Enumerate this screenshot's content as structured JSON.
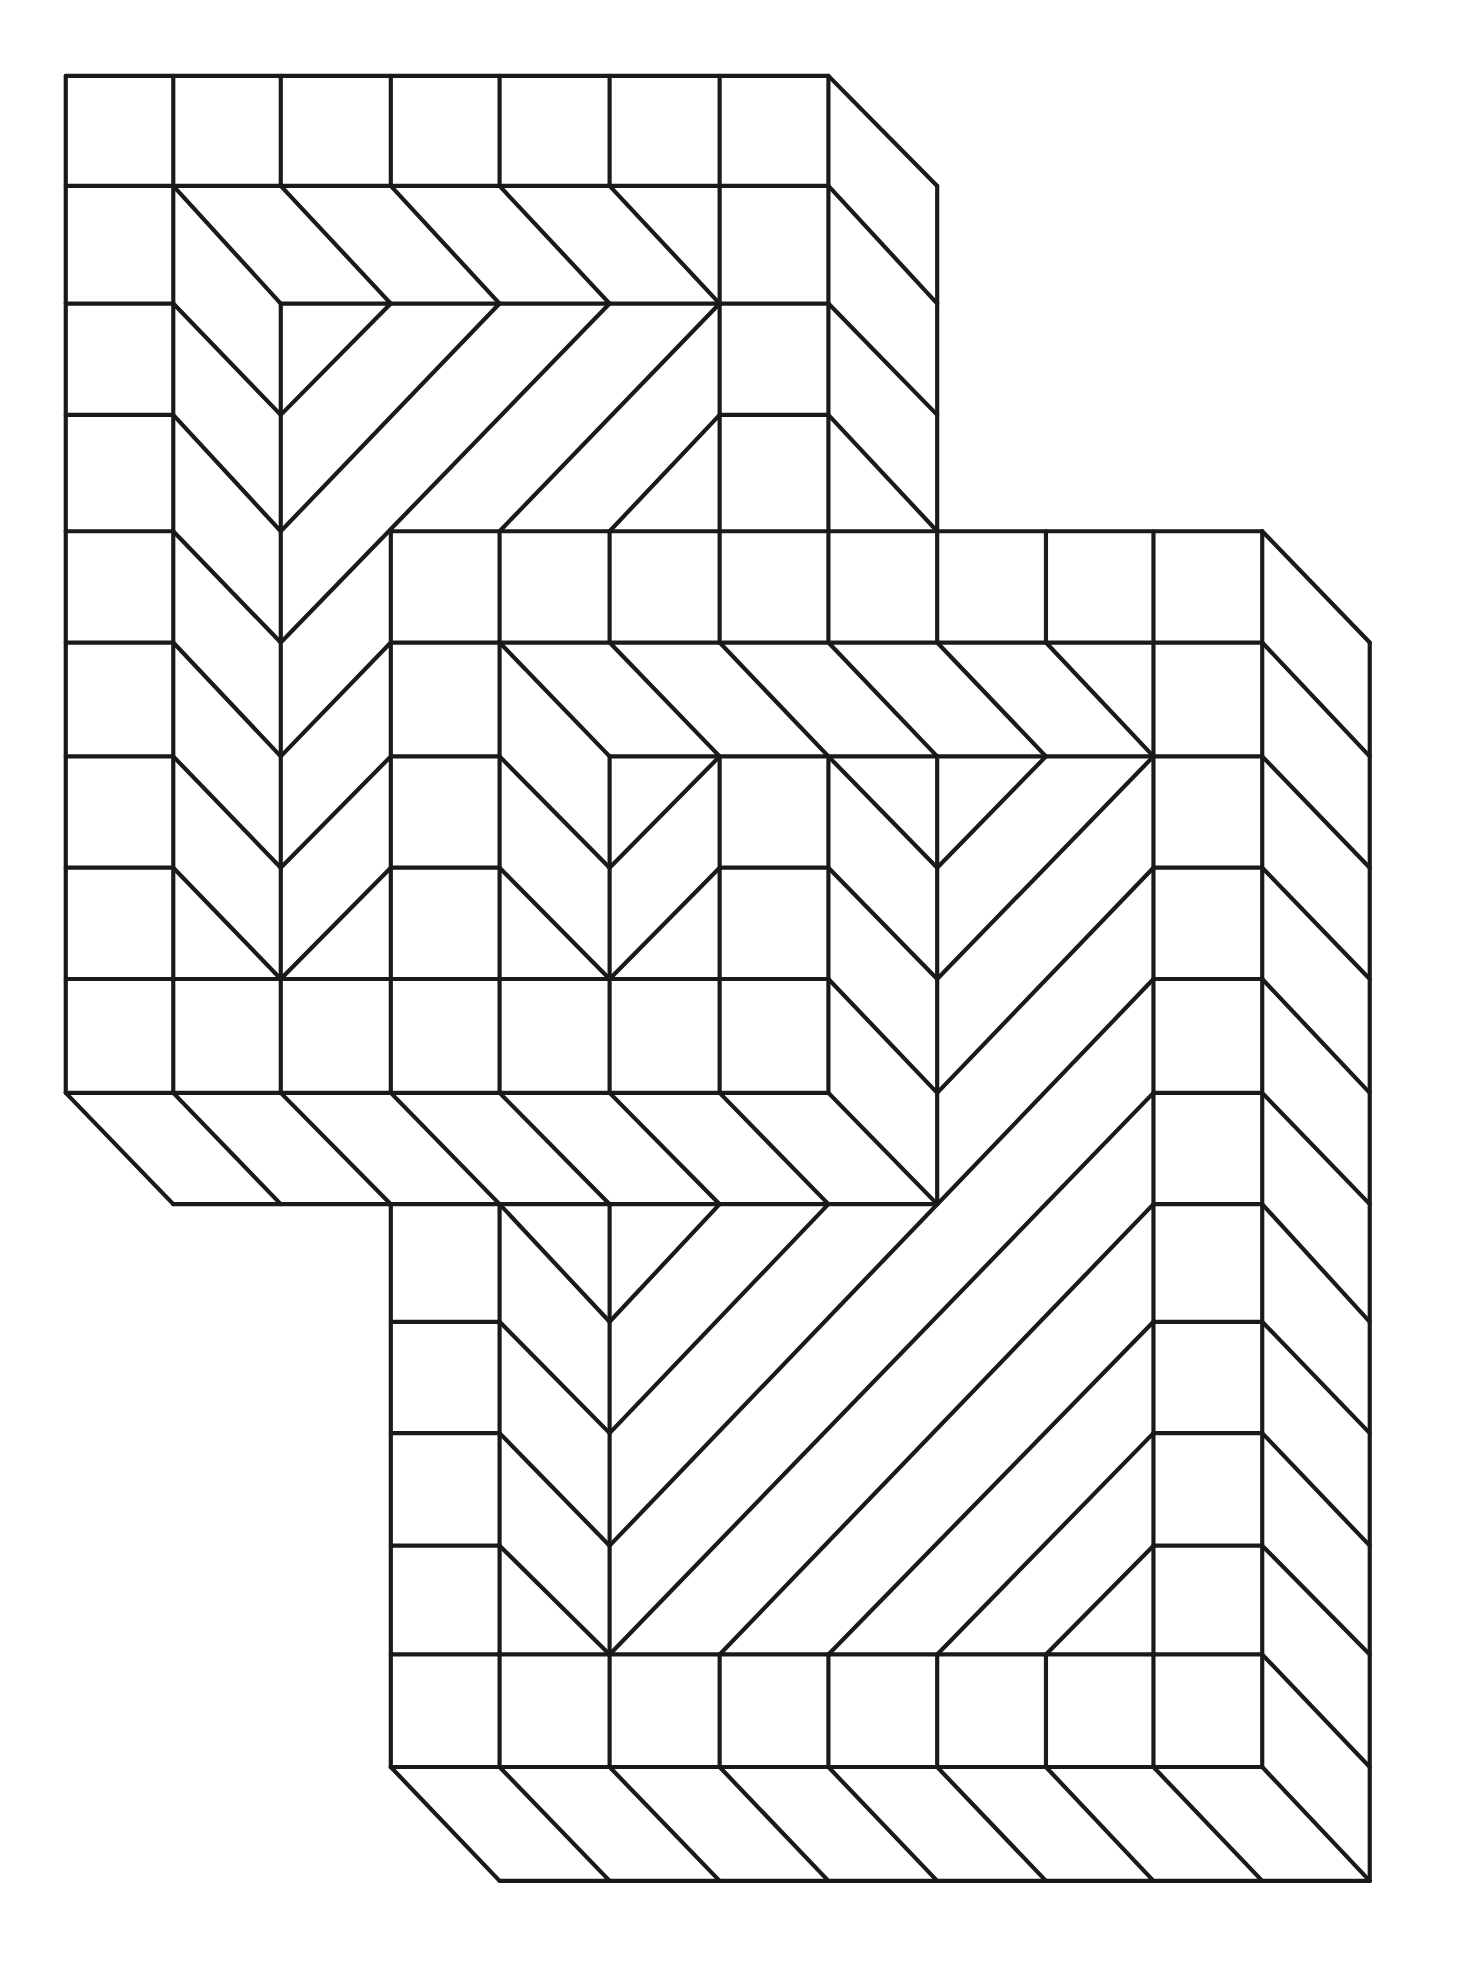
{
  "colors": {
    "background": "#ffffff",
    "line": "#1a1a1a"
  },
  "grid": {
    "viewbox": [
      1152,
      1563
    ],
    "x": [
      52,
      137,
      222,
      309,
      395,
      482,
      569,
      655,
      741,
      827,
      912,
      998,
      1083
    ],
    "y": [
      60,
      147,
      240,
      328,
      420,
      508,
      598,
      686,
      774,
      864,
      952,
      1045,
      1133,
      1222,
      1308,
      1397,
      1487
    ]
  },
  "blocks": [
    {
      "name": "upper-left-block",
      "segments": [
        [
          0,
          0,
          7,
          0
        ],
        [
          7,
          0,
          8,
          1
        ],
        [
          8,
          1,
          8,
          4
        ],
        [
          0,
          1,
          7,
          1
        ],
        [
          7,
          1,
          8,
          2
        ],
        [
          0,
          2,
          1,
          2
        ],
        [
          2,
          2,
          7,
          2
        ],
        [
          7,
          2,
          8,
          3
        ],
        [
          0,
          3,
          1,
          3
        ],
        [
          6,
          3,
          7,
          3
        ],
        [
          7,
          3,
          8,
          4
        ],
        [
          0,
          4,
          1,
          4
        ],
        [
          0,
          5,
          1,
          5
        ],
        [
          0,
          6,
          1,
          6
        ],
        [
          0,
          7,
          1,
          7
        ],
        [
          0,
          8,
          7,
          8
        ],
        [
          0,
          9,
          7,
          9
        ],
        [
          0,
          0,
          0,
          9
        ],
        [
          1,
          0,
          1,
          9
        ],
        [
          2,
          0,
          2,
          1
        ],
        [
          2,
          2,
          2,
          9
        ],
        [
          3,
          0,
          3,
          1
        ],
        [
          4,
          0,
          4,
          1
        ],
        [
          5,
          0,
          5,
          1
        ],
        [
          6,
          0,
          6,
          4
        ],
        [
          7,
          0,
          7,
          4
        ],
        [
          1,
          1,
          2,
          2
        ],
        [
          2,
          1,
          3,
          2
        ],
        [
          3,
          1,
          4,
          2
        ],
        [
          4,
          1,
          5,
          2
        ],
        [
          5,
          1,
          6,
          2
        ],
        [
          1,
          2,
          2,
          3
        ],
        [
          1,
          3,
          2,
          4
        ],
        [
          1,
          4,
          2,
          5
        ],
        [
          1,
          5,
          2,
          6
        ],
        [
          1,
          6,
          2,
          7
        ],
        [
          1,
          7,
          2,
          8
        ],
        [
          2,
          3,
          3,
          2
        ],
        [
          2,
          4,
          4,
          2
        ],
        [
          2,
          5,
          5,
          2
        ],
        [
          2,
          6,
          3,
          5
        ],
        [
          2,
          7,
          3,
          6
        ],
        [
          2,
          8,
          3,
          7
        ],
        [
          4,
          4,
          6,
          2
        ],
        [
          5,
          4,
          6,
          3
        ],
        [
          0,
          9,
          1,
          10
        ],
        [
          1,
          9,
          2,
          10
        ],
        [
          2,
          9,
          3,
          10
        ],
        [
          3,
          9,
          4,
          10
        ],
        [
          4,
          9,
          5,
          10
        ],
        [
          5,
          9,
          6,
          10
        ],
        [
          6,
          9,
          7,
          10
        ],
        [
          7,
          9,
          8,
          10
        ],
        [
          1,
          10,
          8,
          10
        ]
      ]
    },
    {
      "name": "lower-right-block",
      "segments": [
        [
          3,
          4,
          11,
          4
        ],
        [
          11,
          4,
          12,
          5
        ],
        [
          12,
          5,
          12,
          16
        ],
        [
          3,
          5,
          11,
          5
        ],
        [
          3,
          4,
          3,
          9
        ],
        [
          3,
          10,
          3,
          15
        ],
        [
          4,
          4,
          4,
          9
        ],
        [
          4,
          10,
          4,
          15
        ],
        [
          5,
          4,
          5,
          5
        ],
        [
          6,
          4,
          6,
          5
        ],
        [
          7,
          4,
          7,
          5
        ],
        [
          8,
          4,
          8,
          5
        ],
        [
          9,
          4,
          9,
          5
        ],
        [
          10,
          4,
          10,
          15
        ],
        [
          11,
          4,
          11,
          15
        ],
        [
          3,
          6,
          4,
          6
        ],
        [
          3,
          7,
          4,
          7
        ],
        [
          3,
          11,
          4,
          11
        ],
        [
          3,
          12,
          4,
          12
        ],
        [
          3,
          13,
          4,
          13
        ],
        [
          10,
          6,
          11,
          6
        ],
        [
          10,
          7,
          11,
          7
        ],
        [
          10,
          8,
          11,
          8
        ],
        [
          10,
          9,
          11,
          9
        ],
        [
          10,
          10,
          11,
          10
        ],
        [
          10,
          11,
          11,
          11
        ],
        [
          10,
          12,
          11,
          12
        ],
        [
          10,
          13,
          11,
          13
        ],
        [
          11,
          5,
          12,
          6
        ],
        [
          11,
          6,
          12,
          7
        ],
        [
          11,
          7,
          12,
          8
        ],
        [
          11,
          8,
          12,
          9
        ],
        [
          11,
          9,
          12,
          10
        ],
        [
          11,
          10,
          12,
          11
        ],
        [
          11,
          11,
          12,
          12
        ],
        [
          11,
          12,
          12,
          13
        ],
        [
          11,
          13,
          12,
          14
        ],
        [
          11,
          14,
          12,
          15
        ],
        [
          11,
          15,
          12,
          16
        ],
        [
          3,
          14,
          11,
          14
        ],
        [
          3,
          15,
          11,
          15
        ],
        [
          5,
          14,
          5,
          15
        ],
        [
          6,
          14,
          6,
          15
        ],
        [
          7,
          14,
          7,
          15
        ],
        [
          8,
          14,
          8,
          15
        ],
        [
          9,
          14,
          9,
          15
        ],
        [
          3,
          15,
          4,
          16
        ],
        [
          4,
          15,
          5,
          16
        ],
        [
          5,
          15,
          6,
          16
        ],
        [
          6,
          15,
          7,
          16
        ],
        [
          7,
          15,
          8,
          16
        ],
        [
          8,
          15,
          9,
          16
        ],
        [
          9,
          15,
          10,
          16
        ],
        [
          10,
          15,
          11,
          16
        ],
        [
          4,
          16,
          12,
          16
        ],
        [
          4,
          5,
          5,
          6
        ],
        [
          5,
          5,
          6,
          6
        ],
        [
          6,
          5,
          7,
          6
        ],
        [
          7,
          5,
          8,
          6
        ],
        [
          8,
          5,
          9,
          6
        ],
        [
          9,
          5,
          10,
          6
        ],
        [
          5,
          6,
          10,
          6
        ],
        [
          5,
          6,
          5,
          9
        ],
        [
          6,
          6,
          6,
          9
        ],
        [
          7,
          6,
          7,
          9
        ],
        [
          8,
          6,
          8,
          10
        ],
        [
          4,
          6,
          5,
          7
        ],
        [
          4,
          7,
          5,
          8
        ],
        [
          5,
          7,
          6,
          6
        ],
        [
          5,
          8,
          6,
          7
        ],
        [
          6,
          7,
          7,
          7
        ],
        [
          7,
          6,
          8,
          7
        ],
        [
          7,
          7,
          8,
          8
        ],
        [
          7,
          8,
          8,
          9
        ],
        [
          8,
          7,
          9,
          6
        ],
        [
          8,
          8,
          10,
          6
        ],
        [
          8,
          9,
          10,
          7
        ],
        [
          5,
          10,
          5,
          14
        ],
        [
          4,
          10,
          5,
          11
        ],
        [
          4,
          11,
          5,
          12
        ],
        [
          4,
          12,
          5,
          13
        ],
        [
          4,
          13,
          5,
          14
        ],
        [
          5,
          11,
          6,
          10
        ],
        [
          5,
          12,
          7,
          10
        ],
        [
          5,
          13,
          10,
          8
        ],
        [
          5,
          14,
          10,
          9
        ],
        [
          6,
          14,
          10,
          10
        ],
        [
          7,
          14,
          10,
          11
        ],
        [
          8,
          14,
          10,
          12
        ],
        [
          9,
          14,
          10,
          13
        ]
      ]
    }
  ]
}
